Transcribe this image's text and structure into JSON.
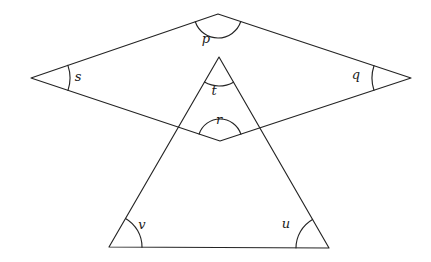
{
  "figure": {
    "name": "angle-diagram",
    "background_color": "#ffffff",
    "line_color": "#242424",
    "label_color": "#1b1b1b"
  },
  "chart_data": {
    "type": "diagram",
    "title": "",
    "shapes": [
      {
        "name": "quadrilateral",
        "vertices": [
          {
            "label": "top",
            "x": 218,
            "y": 14
          },
          {
            "label": "right",
            "x": 411,
            "y": 78
          },
          {
            "label": "bottom",
            "x": 220,
            "y": 141
          },
          {
            "label": "left",
            "x": 31,
            "y": 78
          }
        ]
      },
      {
        "name": "triangle",
        "vertices": [
          {
            "label": "apex",
            "x": 219,
            "y": 57
          },
          {
            "label": "bottom-right",
            "x": 329,
            "y": 248
          },
          {
            "label": "bottom-left",
            "x": 109,
            "y": 247
          }
        ]
      }
    ],
    "angles": [
      {
        "id": "p",
        "label": "p",
        "vertex_x": 218,
        "vertex_y": 14,
        "label_x": 206,
        "label_y": 39,
        "arc_radius": 24,
        "shape": "quadrilateral",
        "position": "top"
      },
      {
        "id": "s",
        "label": "s",
        "vertex_x": 31,
        "vertex_y": 78,
        "label_x": 78,
        "label_y": 77,
        "arc_radius": 39,
        "shape": "quadrilateral",
        "position": "left"
      },
      {
        "id": "q",
        "label": "q",
        "vertex_x": 411,
        "vertex_y": 78,
        "label_x": 356,
        "label_y": 75,
        "arc_radius": 39,
        "shape": "quadrilateral",
        "position": "right"
      },
      {
        "id": "r",
        "label": "r",
        "vertex_x": 220,
        "vertex_y": 141,
        "label_x": 219,
        "label_y": 120,
        "arc_radius": 22,
        "shape": "quadrilateral",
        "position": "bottom"
      },
      {
        "id": "t",
        "label": "t",
        "vertex_x": 219,
        "vertex_y": 57,
        "label_x": 214,
        "label_y": 91,
        "arc_radius": 29,
        "shape": "triangle",
        "position": "apex"
      },
      {
        "id": "v",
        "label": "v",
        "vertex_x": 109,
        "vertex_y": 247,
        "label_x": 142,
        "label_y": 225,
        "arc_radius": 33,
        "shape": "triangle",
        "position": "bottom-left"
      },
      {
        "id": "u",
        "label": "u",
        "vertex_x": 329,
        "vertex_y": 248,
        "label_x": 286,
        "label_y": 224,
        "arc_radius": 33,
        "shape": "triangle",
        "position": "bottom-right"
      }
    ]
  }
}
